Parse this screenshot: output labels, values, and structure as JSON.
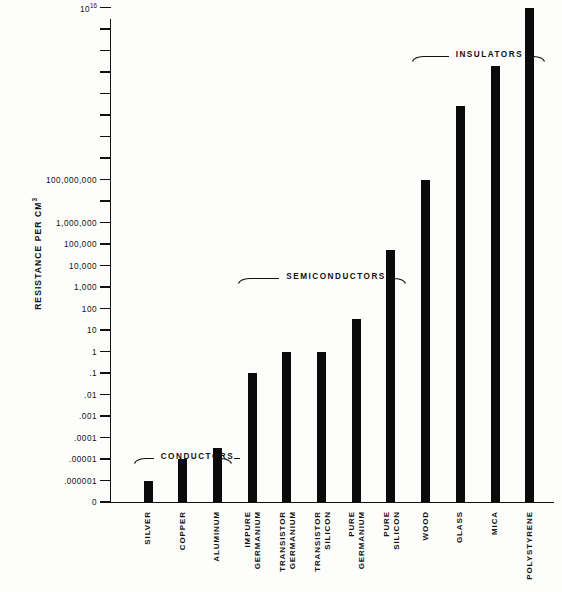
{
  "chart_data": {
    "type": "bar",
    "title": "",
    "xlabel": "",
    "ylabel": "RESISTANCE PER CM",
    "ylabel_exponent": "3",
    "scale": "log",
    "grid": false,
    "legend": "none",
    "axis_origin_label": "0",
    "categories": [
      "SILVER",
      "COPPER",
      "ALUMINUM",
      "IMPURE GERMANIUM",
      "TRANSISTOR GERMANIUM",
      "TRANSISTOR SILICON",
      "PURE GERMANIUM",
      "PURE SILICON",
      "WOOD",
      "GLASS",
      "MICA",
      "POLYSTYRENE"
    ],
    "category_lines": [
      [
        "SILVER"
      ],
      [
        "COPPER"
      ],
      [
        "ALUMINUM"
      ],
      [
        "IMPURE",
        "GERMANIUM"
      ],
      [
        "TRANSISTOR",
        "GERMANIUM"
      ],
      [
        "TRANSISTOR",
        "SILICON"
      ],
      [
        "PURE",
        "GERMANIUM"
      ],
      [
        "PURE",
        "SILICON"
      ],
      [
        "WOOD"
      ],
      [
        "GLASS"
      ],
      [
        "MICA"
      ],
      [
        "POLYSTYRENE"
      ]
    ],
    "values": [
      1e-06,
      1e-05,
      3e-05,
      0.1,
      1,
      1,
      30,
      50000,
      100000000,
      300000000000,
      30000000000000,
      10000000000000000
    ],
    "value_exponents": [
      -6,
      -5,
      -4.5,
      -1,
      0,
      0,
      1.5,
      4.7,
      8,
      11.4,
      13.3,
      16
    ],
    "ylim": [
      0,
      1e+18
    ],
    "tick_labels": [
      "0",
      ".000001",
      ".00001",
      ".0001",
      ".001",
      ".01",
      ".1",
      "1",
      "10",
      "100",
      "1,000",
      "10,000",
      "100,000",
      "1,000,000",
      "",
      "100,000,000",
      "",
      "",
      "",
      "",
      "",
      "",
      "",
      "10^16",
      "",
      "10^18",
      ""
    ],
    "tick_exponent_labels": {
      "16": {
        "base": "10",
        "exp": "16"
      },
      "18": {
        "base": "10",
        "exp": "18"
      }
    },
    "groups": [
      {
        "label": "CONDUCTORS",
        "from": 0,
        "to": 2
      },
      {
        "label": "SEMICONDUCTORS",
        "from": 3,
        "to": 7
      },
      {
        "label": "INSULATORS",
        "from": 8,
        "to": 11
      }
    ],
    "colors": {
      "bar": "#0b0b0b",
      "axis": "#111111",
      "background": "#fdfdfb"
    }
  }
}
